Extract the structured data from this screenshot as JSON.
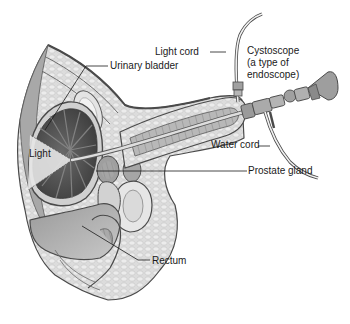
{
  "diagram": {
    "type": "anatomical-illustration",
    "labels": [
      {
        "id": "light-cord",
        "text": "Light cord"
      },
      {
        "id": "urinary-bladder",
        "text": "Urinary bladder"
      },
      {
        "id": "cystoscope",
        "text": "Cystoscope\n(a type of\nendoscope)"
      },
      {
        "id": "light",
        "text": "Light"
      },
      {
        "id": "water-cord",
        "text": "Water cord"
      },
      {
        "id": "prostate-gland",
        "text": "Prostate gland"
      },
      {
        "id": "rectum",
        "text": "Rectum"
      }
    ],
    "colors": {
      "background": "#ffffff",
      "outline": "#4a4a4a",
      "tissue_light": "#d9d9d9",
      "tissue_mid": "#b3b3b3",
      "bladder_dark": "#5e5e5e",
      "leader_line": "#1a1a1a"
    }
  }
}
